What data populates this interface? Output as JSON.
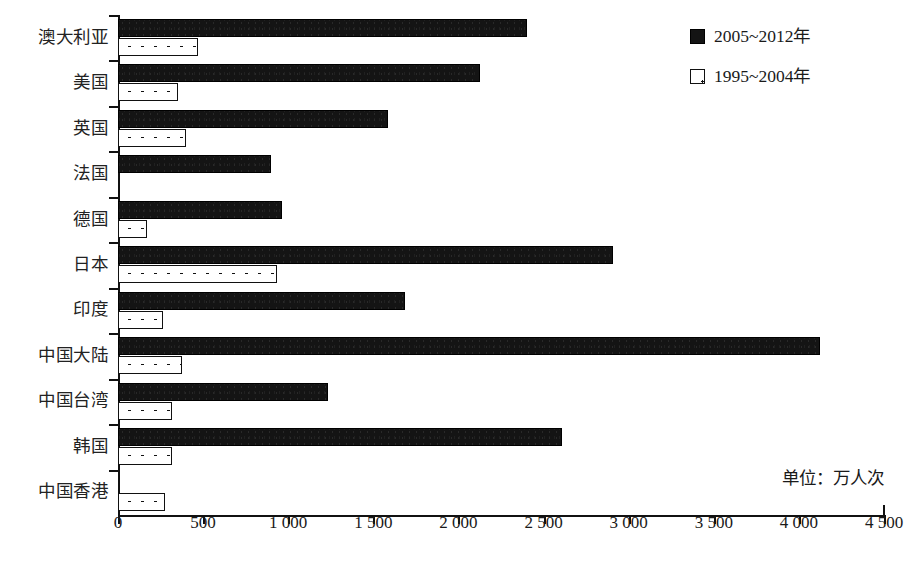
{
  "chart_data": {
    "type": "bar",
    "orientation": "horizontal",
    "title": "",
    "xlabel": "",
    "ylabel": "",
    "unit_note": "单位：万人次",
    "xlim": [
      0,
      4500
    ],
    "xticks": [
      0,
      500,
      1000,
      1500,
      2000,
      2500,
      3000,
      3500,
      4000,
      4500
    ],
    "xtick_labels": [
      "0",
      "500",
      "1 000",
      "1 500",
      "2 000",
      "2 500",
      "3 000",
      "3 500",
      "4 000",
      "4 500"
    ],
    "grid": false,
    "legend_position": "top-right",
    "categories": [
      "澳大利亚",
      "美国",
      "英国",
      "法国",
      "德国",
      "日本",
      "印度",
      "中国大陆",
      "中国台湾",
      "韩国",
      "中国香港"
    ],
    "series": [
      {
        "name": "2005~2012年",
        "style": "solid-black",
        "color": "#141414",
        "values": [
          2403,
          2127,
          1586,
          899,
          964,
          2908,
          1686,
          4125,
          1234,
          2609,
          0
        ]
      },
      {
        "name": "1995~2004年",
        "style": "white-dotted",
        "color": "#ffffff",
        "values": [
          470,
          353,
          400,
          0,
          170,
          934,
          264,
          376,
          317,
          317,
          276
        ]
      }
    ]
  },
  "legend": {
    "items": [
      {
        "label": "2005~2012年",
        "style": "dark"
      },
      {
        "label": "1995~2004年",
        "style": "dot"
      }
    ]
  }
}
